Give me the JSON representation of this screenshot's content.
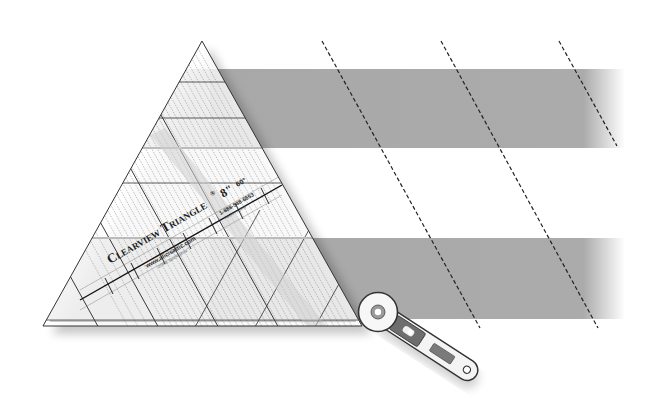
{
  "diagram": {
    "colors": {
      "strip_gray": "#a9a9a9",
      "strip_white": "#ffffff",
      "outline": "#2a2a2a",
      "dashed_cut_line": "#222222",
      "ruler_lines": "#333333"
    },
    "strips": [
      {
        "name": "top-strip",
        "fill": "gray"
      },
      {
        "name": "middle-strip",
        "fill": "white"
      },
      {
        "name": "bottom-strip",
        "fill": "gray"
      }
    ],
    "cut_lines": {
      "count": 3,
      "style": "dashed",
      "angle": "60°"
    },
    "ruler": {
      "brand": "Clearview Triangle",
      "trademark": "®",
      "size": "8\"",
      "angle": "60°",
      "website": "www.alicisattic.com",
      "phone": "1-888-548-6653",
      "copyright": "©1998, Sara Nephew",
      "patent": "Patent Pending"
    },
    "tool": {
      "name": "rotary cutter"
    }
  }
}
